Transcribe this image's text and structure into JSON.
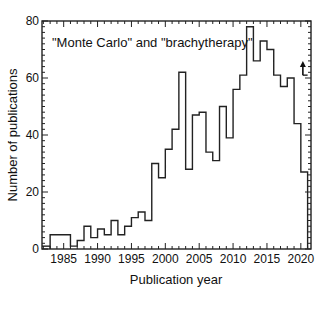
{
  "chart_data": {
    "type": "bar",
    "style": "step-histogram",
    "title": "",
    "annotation": "\"Monte Carlo\" and \"brachytherapy\"",
    "xlabel": "Publication year",
    "ylabel": "Number of publications",
    "xlim": [
      1981.8,
      2021.5
    ],
    "ylim": [
      0,
      80
    ],
    "xticks": [
      1985,
      1990,
      1995,
      2000,
      2005,
      2010,
      2015,
      2020
    ],
    "yticks": [
      0,
      20,
      40,
      60,
      80
    ],
    "grid": false,
    "legend": null,
    "categories": [
      1983,
      1984,
      1985,
      1986,
      1987,
      1988,
      1989,
      1990,
      1991,
      1992,
      1993,
      1994,
      1995,
      1996,
      1997,
      1998,
      1999,
      2000,
      2001,
      2002,
      2003,
      2004,
      2005,
      2006,
      2007,
      2008,
      2009,
      2010,
      2011,
      2012,
      2013,
      2014,
      2015,
      2016,
      2017,
      2018,
      2019,
      2020
    ],
    "values": [
      5,
      5,
      5,
      1,
      3,
      8,
      4,
      7,
      5,
      10,
      5,
      8,
      11,
      13,
      10,
      30,
      25,
      35,
      42,
      62,
      28,
      47,
      48,
      34,
      31,
      50,
      39,
      56,
      61,
      78,
      66,
      73,
      70,
      61,
      57,
      60,
      44,
      27
    ],
    "extras": {
      "baseline_bar": {
        "x_start": 1981.8,
        "x_end": 1983,
        "value": 1
      },
      "projection_2020": {
        "from": 61,
        "to": 66,
        "note": "upward arrow indicating projected count for incomplete year"
      }
    }
  },
  "labels": {
    "annotation": "\"Monte Carlo\" and \"brachytherapy\"",
    "xlabel": "Publication year",
    "ylabel": "Number of publications"
  }
}
